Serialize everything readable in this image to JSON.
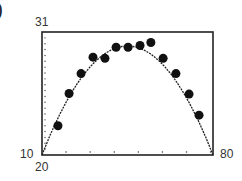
{
  "panel_marker": ")",
  "chart_data": {
    "type": "scatter",
    "title": "",
    "xlabel": "",
    "ylabel": "",
    "xlim": [
      20,
      80
    ],
    "ylim": [
      10,
      31
    ],
    "axis_labels": {
      "ymax": "31",
      "ymin": "10",
      "xmin": "20",
      "xmax": "80"
    },
    "grid": false,
    "series": [
      {
        "name": "data",
        "kind": "points",
        "x": [
          25.6,
          29.5,
          33.7,
          37.9,
          42.1,
          46.0,
          50.2,
          54.4,
          58.2,
          62.5,
          67.0,
          71.6,
          75.1
        ],
        "y": [
          15.0,
          20.5,
          23.9,
          26.7,
          26.5,
          28.4,
          28.4,
          28.7,
          29.2,
          26.5,
          23.9,
          20.4,
          16.8
        ]
      },
      {
        "name": "fit",
        "kind": "curve",
        "model": "quadratic",
        "vertex": [
          50,
          28.6
        ],
        "x_roots_at_ymin": [
          20,
          80
        ]
      }
    ]
  }
}
